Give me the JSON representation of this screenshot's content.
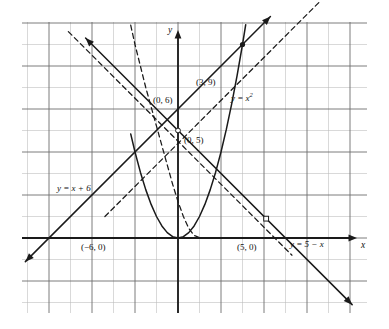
{
  "figure": {
    "kind": "cartesian-graph",
    "background": "#ffffff",
    "grid": {
      "left_px": 22,
      "right_px": 367,
      "top_px": 22,
      "bottom_px": 313,
      "cell_px": 21.5,
      "minor_color": "#b9b9b9",
      "major_color": "#6e6e6e",
      "major_every": 2,
      "show": true
    },
    "axes": {
      "origin_x_px": 178,
      "origin_y_px": 238,
      "color": "#1a1a1a",
      "x_label": "x",
      "y_label": "y",
      "x_arrow": "right",
      "y_arrow": "up"
    }
  },
  "chart_data": {
    "type": "line",
    "title": "",
    "xlabel": "x",
    "ylabel": "y",
    "xlim": [
      -7.3,
      8.8
    ],
    "ylim": [
      -3.3,
      10.1
    ],
    "grid": true,
    "legend": "inline-annotations",
    "series": [
      {
        "name": "y = x²",
        "label": "y = x²",
        "equation": "y = x^2",
        "style": "solid",
        "color": "#1a1a1a",
        "x": [
          -2.2,
          -2.0,
          -1.75,
          -1.5,
          -1.25,
          -1.0,
          -0.75,
          -0.5,
          -0.25,
          0,
          0.25,
          0.5,
          0.75,
          1.0,
          1.25,
          1.5,
          1.75,
          2.0,
          2.25,
          2.5,
          2.75,
          3.0,
          3.15
        ],
        "y": [
          4.84,
          4.0,
          3.0625,
          2.25,
          1.5625,
          1.0,
          0.5625,
          0.25,
          0.0625,
          0,
          0.0625,
          0.25,
          0.5625,
          1.0,
          1.5625,
          2.25,
          3.0625,
          4.0,
          5.0625,
          6.25,
          7.5625,
          9.0,
          9.9225
        ]
      },
      {
        "name": "y = x + 6",
        "label": "y = x + 6",
        "equation": "y = x + 6",
        "style": "solid",
        "color": "#1a1a1a",
        "x": [
          -7.1,
          4.3
        ],
        "y": [
          -1.1,
          10.3
        ],
        "arrows": "both"
      },
      {
        "name": "y = 5 − x",
        "label": "y = 5 − x",
        "equation": "y = 5 - x",
        "style": "solid",
        "color": "#1a1a1a",
        "x": [
          -4.3,
          8.1
        ],
        "y": [
          9.3,
          -3.1
        ],
        "arrows": "both"
      },
      {
        "name": "reflected-parabola-dashed",
        "label": "",
        "equation": "x = y^2 reflected branch",
        "style": "dashed",
        "color": "#1a1a1a",
        "x": [
          -2.2,
          -2.0,
          -1.75,
          -1.5,
          -1.25,
          -1.0,
          -0.75,
          -0.5,
          -0.25,
          0,
          0.25,
          0.5,
          0.75,
          1.0,
          1.2
        ],
        "y": [
          9.9,
          9.0,
          8.0,
          7.0,
          6.1,
          5.2,
          4.3,
          3.4,
          2.5,
          1.7,
          1.0,
          0.45,
          0.12,
          0.02,
          0.0
        ],
        "note": "steep dashed curve descending from upper area to near origin"
      },
      {
        "name": "inverse-line-dashed",
        "label": "",
        "equation": "dashed line through (0,5) region ascending",
        "style": "dashed",
        "color": "#1a1a1a",
        "x": [
          -3.4,
          6.6
        ],
        "y": [
          1.0,
          11.0
        ],
        "note": "dashed ascending line, reflection of y = 5 - x in y = x"
      },
      {
        "name": "descending-dashed",
        "label": "",
        "equation": "dashed descending line upper-left to lower-right",
        "style": "dashed",
        "color": "#1a1a1a",
        "x": [
          -5.1,
          5.3
        ],
        "y": [
          9.6,
          -0.8
        ],
        "note": "dashed line parallel to y = 5 - x passing through open marker"
      }
    ],
    "points": [
      {
        "label": "(3, 9)",
        "x": 3,
        "y": 9,
        "marker": "filled-dot",
        "label_dx": -34,
        "label_dy": -6
      },
      {
        "label": "(0, 6)",
        "x": 0,
        "y": 6,
        "marker": "none",
        "label_dx": -24,
        "label_dy": -4
      },
      {
        "label": "(0, 5)",
        "x": 0,
        "y": 5,
        "marker": "open-circle",
        "label_dx": 4,
        "label_dy": 12
      },
      {
        "label": "(−6, 0)",
        "x": -6,
        "y": 0,
        "marker": "none",
        "label_dx": 22,
        "label_dy": 13
      },
      {
        "label": "(5, 0)",
        "x": 5,
        "y": 0,
        "marker": "none",
        "label_dx": -16,
        "label_dy": 13
      },
      {
        "label": "",
        "x": 4.1,
        "y": 0.9,
        "marker": "open-square",
        "label_dx": 0,
        "label_dy": 0
      }
    ],
    "annotations": [
      {
        "text": "y = x²",
        "x_px": 231,
        "y_px": 92,
        "italic": true
      },
      {
        "text": "y = x + 6",
        "x_px": 57,
        "y_px": 184,
        "italic": true
      },
      {
        "text": "y = 5 − x",
        "x_px": 290,
        "y_px": 240,
        "italic": true
      },
      {
        "text": "(3, 9)",
        "x_px": 196,
        "y_px": 78
      },
      {
        "text": "(0, 6)",
        "x_px": 153,
        "y_px": 96
      },
      {
        "text": "(0, 5)",
        "x_px": 184,
        "y_px": 136
      },
      {
        "text": "(−6, 0)",
        "x_px": 81,
        "y_px": 243
      },
      {
        "text": "(5, 0)",
        "x_px": 237,
        "y_px": 243
      }
    ]
  }
}
